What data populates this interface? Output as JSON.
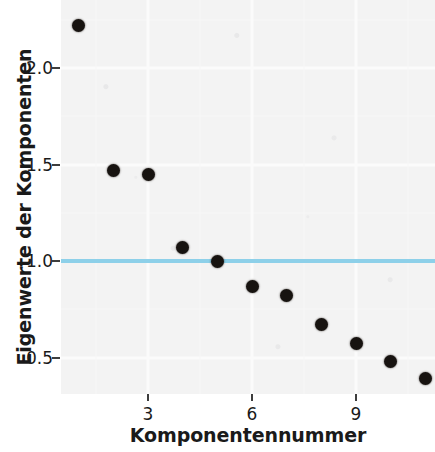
{
  "chart_data": {
    "type": "scatter",
    "title": "",
    "subtitle": "",
    "xlabel": "Komponentennummer",
    "ylabel": "Eigenwerte der Komponenten",
    "x": [
      1,
      2,
      3,
      4,
      5,
      6,
      7,
      8,
      9,
      10,
      11
    ],
    "values": [
      2.22,
      1.47,
      1.45,
      1.07,
      1.0,
      0.87,
      0.82,
      0.67,
      0.57,
      0.48,
      0.39
    ],
    "series": [
      {
        "name": "Eigenwerte",
        "values": [
          2.22,
          1.47,
          1.45,
          1.07,
          1.0,
          0.87,
          0.82,
          0.67,
          0.57,
          0.48,
          0.39
        ]
      }
    ],
    "xlim": [
      0.5,
      11.5
    ],
    "ylim": [
      0.3,
      2.32
    ],
    "xticks": [
      3,
      6,
      9
    ],
    "xtick_labels": [
      "3",
      "6",
      "9"
    ],
    "yticks": [
      0.5,
      1.0,
      1.5,
      2.0
    ],
    "ytick_labels": [
      "0.5",
      "1.0",
      "1.5",
      "2.0"
    ],
    "grid": true,
    "legend": "none",
    "annotations": [
      {
        "type": "hline",
        "label": "Kaiser-Kriterium",
        "y": 1.0,
        "color": "#87cde8"
      }
    ],
    "colors": {
      "point": "#171310",
      "reference_line": "#87cde8",
      "panel_background": "#f3f3f3",
      "gridline": "#fbfbfb",
      "text": "#1a1a1a"
    }
  },
  "axes": {
    "x": {
      "label": "Komponentennummer",
      "ticks": [
        "3",
        "6",
        "9"
      ]
    },
    "y": {
      "label": "Eigenwerte der Komponenten",
      "ticks": [
        "2.0",
        "1.5",
        "1.0",
        "0.5"
      ]
    }
  }
}
